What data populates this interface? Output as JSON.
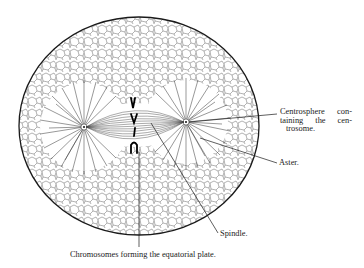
{
  "figure": {
    "labels": {
      "centrosphere": [
        "Centrosphere con-",
        "taining the cen-",
        "trosome."
      ],
      "aster": "Aster.",
      "spindle": "Spindle.",
      "chromosomes": "Chromosomes forming the equatorial plate."
    },
    "colors": {
      "ink": "#1a1a1a",
      "background": "#ffffff"
    }
  }
}
